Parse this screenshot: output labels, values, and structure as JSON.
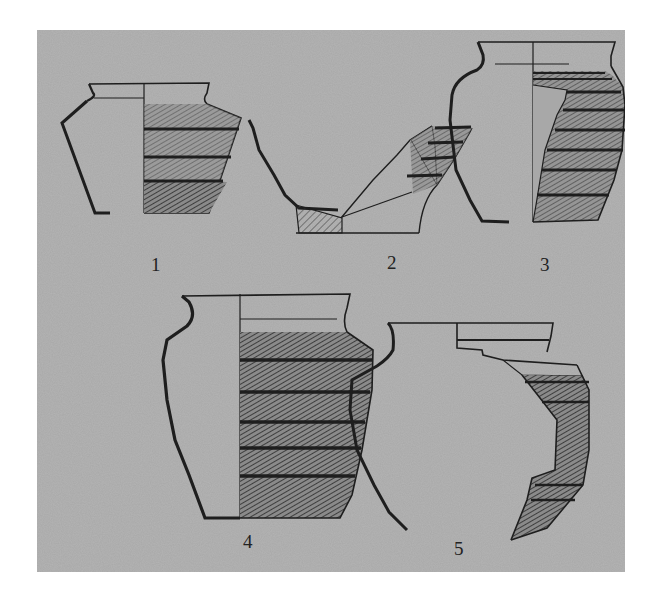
{
  "figure": {
    "background_color": "#a8a8a8",
    "line_color": "#1e1e1e",
    "vessels": [
      {
        "label": "1",
        "type": "carinated jar"
      },
      {
        "label": "2",
        "type": "bowl base fragment"
      },
      {
        "label": "3",
        "type": "ovoid jar"
      },
      {
        "label": "4",
        "type": "tall jar"
      },
      {
        "label": "5",
        "type": "jar fragment"
      }
    ]
  }
}
